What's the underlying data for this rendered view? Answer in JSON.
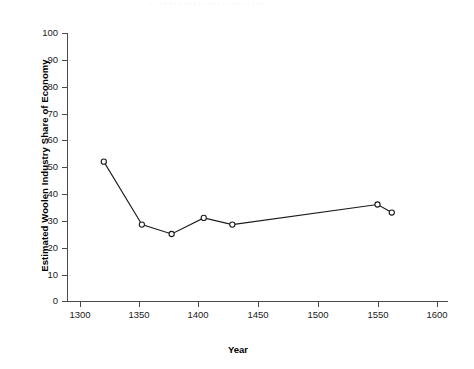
{
  "page": {
    "running_head": "· · · · · · · · · · · · · · · · · · · · · · · · ·",
    "page_number": ""
  },
  "chart_data": {
    "type": "line",
    "title": "",
    "xlabel": "Year",
    "ylabel": "Estimated Woolen Industry Share of Economy",
    "xlim": [
      1285,
      1615
    ],
    "ylim": [
      0,
      100
    ],
    "xticks": [
      1300,
      1350,
      1400,
      1450,
      1500,
      1550,
      1600
    ],
    "yticks": [
      0,
      10,
      20,
      30,
      40,
      50,
      60,
      70,
      80,
      90,
      100
    ],
    "grid": false,
    "legend": "none",
    "marker": "open-circle",
    "line_color": "#1a1a1a",
    "marker_fill": "#ffffff",
    "x": [
      1320,
      1352,
      1377,
      1404,
      1428,
      1550,
      1562
    ],
    "values": [
      52,
      28.5,
      25,
      31,
      28.5,
      36,
      33
    ],
    "points": [
      {
        "x": 1320,
        "y": 52
      },
      {
        "x": 1352,
        "y": 28.5
      },
      {
        "x": 1377,
        "y": 25
      },
      {
        "x": 1404,
        "y": 31
      },
      {
        "x": 1428,
        "y": 28.5
      },
      {
        "x": 1550,
        "y": 36
      },
      {
        "x": 1562,
        "y": 33
      }
    ]
  }
}
